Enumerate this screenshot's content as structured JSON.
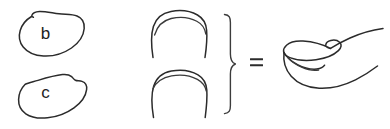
{
  "figure": {
    "background_color": "#ffffff",
    "stroke_color": "#2b2b2b",
    "width": 390,
    "height": 129,
    "labels": {
      "blob_b": "b",
      "blob_c": "c",
      "equals": "="
    },
    "panels": [
      {
        "name": "blob-b",
        "label": "b",
        "description": "rounded irregular blob outline with small notch at upper left",
        "x": 18,
        "y": 11,
        "width": 67,
        "height": 45
      },
      {
        "name": "blob-c",
        "label": "c",
        "description": "rounded blob outline with angled flat upper edge and notch at upper right",
        "x": 18,
        "y": 72,
        "width": 70,
        "height": 46
      },
      {
        "name": "arch-upper",
        "label": "",
        "description": "inverted U arch outline with inner parallel curve along the crest",
        "x": 150,
        "y": 10,
        "width": 57,
        "height": 48
      },
      {
        "name": "arch-lower",
        "label": "",
        "description": "inverted U arch outline with inner parallel curve along the crest",
        "x": 150,
        "y": 66,
        "width": 57,
        "height": 52
      },
      {
        "name": "composite-shape",
        "label": "",
        "description": "three dimensional perspective view of the combined arch form",
        "x": 283,
        "y": 28,
        "width": 100,
        "height": 62
      }
    ],
    "connectors": [
      {
        "name": "right-curly-brace",
        "symbol": "}",
        "x": 224,
        "y": 14,
        "height": 100
      },
      {
        "name": "equals-sign",
        "symbol": "=",
        "x": 250,
        "y": 58,
        "width": 13,
        "height": 10
      }
    ]
  }
}
